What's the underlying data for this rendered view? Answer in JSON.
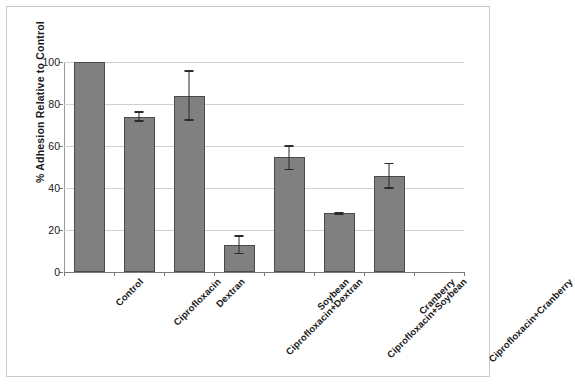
{
  "chart_data": {
    "type": "bar",
    "title": "",
    "subtitle": "",
    "xlabel": "",
    "ylabel": "% Adhesion Relative to Control",
    "ylim": [
      0,
      100
    ],
    "yticks": [
      0,
      20,
      40,
      60,
      80,
      100
    ],
    "ytick_labels": [
      "0",
      "20",
      "40",
      "60",
      "80",
      "100"
    ],
    "grid": "horizontal",
    "legend": "none",
    "bar_color": "#808080",
    "bar_edge_color": "#4a4a4a",
    "error_bar_color": "#2b2b2b",
    "gridline_color": "#d0d0d0",
    "axis_color": "#7a7a7a",
    "categories": [
      "Control",
      "Ciprofloxacin",
      "Dextran",
      "Ciprofloxacin+Dextran",
      "Soybean",
      "Ciprofloxacin+Soybean",
      "Cranberry",
      "Ciprofloxacin+Cranberry"
    ],
    "values": [
      100,
      74,
      84,
      13,
      55,
      28,
      45.5,
      0
    ],
    "errors_upper": [
      0,
      2.5,
      12,
      4.5,
      5.5,
      0.8,
      6.5,
      0
    ],
    "errors_lower": [
      0,
      2.5,
      12,
      4.5,
      6.5,
      0.8,
      6.0,
      0
    ],
    "series": [
      {
        "name": "% Adhesion Relative to Control",
        "values": [
          100,
          74,
          84,
          13,
          55,
          28,
          45.5,
          0
        ]
      }
    ]
  },
  "axes": {
    "y_title": "% Adhesion Relative to Control"
  }
}
